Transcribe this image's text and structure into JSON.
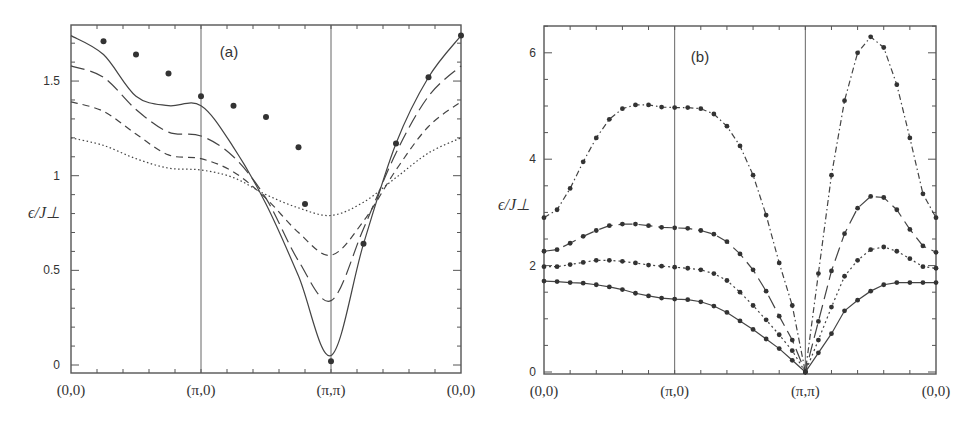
{
  "figure": {
    "panels": [
      {
        "id": "a",
        "label": "(a)",
        "ylabel": "ϵ/J⊥"
      },
      {
        "id": "b",
        "label": "(b)",
        "ylabel": "ϵ/J⊥"
      }
    ]
  },
  "chart_data": [
    {
      "type": "line",
      "title": "(a)",
      "xlabel": "",
      "ylabel": "ϵ/J⊥",
      "x_tick_labels": [
        "(0,0)",
        "(π,0)",
        "(π,π)",
        "(0,0)"
      ],
      "x_tick_positions": [
        0,
        1,
        2,
        3
      ],
      "y_tick_labels": [
        "0",
        "0.5",
        "1",
        "1.5"
      ],
      "y_ticks": [
        0,
        0.5,
        1,
        1.5
      ],
      "ylim": [
        -0.02,
        1.84
      ],
      "xlim": [
        0,
        3
      ],
      "grid": false,
      "vertical_lines_at": [
        1,
        2
      ],
      "x": [
        0,
        0.25,
        0.5,
        0.75,
        1.0,
        1.25,
        1.5,
        1.75,
        2.0,
        2.25,
        2.5,
        2.75,
        3.0
      ],
      "series": [
        {
          "name": "solid (with markers)",
          "style": "solid",
          "markers": true,
          "values": [
            1.74,
            1.64,
            1.42,
            1.37,
            1.37,
            1.15,
            0.85,
            0.47,
            0.05,
            0.64,
            1.17,
            1.52,
            1.74
          ],
          "marker_x": [
            0.25,
            0.5,
            0.75,
            1.0,
            1.25,
            1.5,
            1.75,
            1.8,
            2.0,
            2.25,
            2.5,
            2.75,
            3.0
          ],
          "marker_values": [
            1.71,
            1.64,
            1.54,
            1.42,
            1.37,
            1.31,
            1.15,
            0.85,
            0.02,
            0.64,
            1.17,
            1.52,
            1.74
          ]
        },
        {
          "name": "long dash",
          "style": "long-dash",
          "markers": false,
          "values": [
            1.58,
            1.52,
            1.35,
            1.23,
            1.21,
            1.1,
            0.88,
            0.55,
            0.34,
            0.72,
            1.12,
            1.42,
            1.58
          ]
        },
        {
          "name": "short dash",
          "style": "short-dash",
          "markers": false,
          "values": [
            1.39,
            1.34,
            1.22,
            1.11,
            1.09,
            1.02,
            0.88,
            0.7,
            0.58,
            0.76,
            1.03,
            1.26,
            1.39
          ]
        },
        {
          "name": "dotted",
          "style": "dotted",
          "markers": false,
          "values": [
            1.2,
            1.16,
            1.09,
            1.04,
            1.03,
            0.99,
            0.9,
            0.83,
            0.79,
            0.86,
            0.99,
            1.12,
            1.2
          ]
        }
      ]
    },
    {
      "type": "line",
      "title": "(b)",
      "xlabel": "",
      "ylabel": "ϵ/J⊥",
      "x_tick_labels": [
        "(0,0)",
        "(π,0)",
        "(π,π)",
        "(0,0)"
      ],
      "x_tick_positions": [
        0,
        1,
        2,
        3
      ],
      "y_tick_labels": [
        "0",
        "2",
        "4",
        "6"
      ],
      "y_ticks": [
        0,
        2,
        4,
        6
      ],
      "ylim": [
        -0.04,
        6.5
      ],
      "xlim": [
        0,
        3
      ],
      "grid": false,
      "vertical_lines_at": [
        1,
        2
      ],
      "x": [
        0,
        0.1,
        0.2,
        0.3,
        0.4,
        0.5,
        0.6,
        0.7,
        0.8,
        0.9,
        1.0,
        1.1,
        1.2,
        1.3,
        1.4,
        1.5,
        1.6,
        1.7,
        1.8,
        1.9,
        2.0,
        2.1,
        2.2,
        2.3,
        2.4,
        2.5,
        2.6,
        2.7,
        2.8,
        2.9,
        3.0
      ],
      "series": [
        {
          "name": "dash-dot (top)",
          "style": "dash-dot",
          "markers": true,
          "values": [
            2.9,
            3.05,
            3.45,
            3.95,
            4.4,
            4.75,
            4.95,
            5.02,
            5.02,
            4.98,
            4.97,
            4.97,
            4.95,
            4.85,
            4.62,
            4.25,
            3.7,
            2.95,
            2.05,
            1.25,
            0.0,
            1.85,
            3.7,
            5.1,
            6.0,
            6.3,
            6.1,
            5.4,
            4.4,
            3.35,
            2.9
          ]
        },
        {
          "name": "long dash",
          "style": "long-dash",
          "markers": true,
          "values": [
            2.27,
            2.3,
            2.42,
            2.55,
            2.66,
            2.75,
            2.78,
            2.78,
            2.75,
            2.72,
            2.71,
            2.7,
            2.66,
            2.59,
            2.45,
            2.22,
            1.92,
            1.52,
            1.05,
            0.6,
            0.0,
            0.95,
            1.9,
            2.6,
            3.08,
            3.3,
            3.28,
            3.05,
            2.68,
            2.37,
            2.25
          ]
        },
        {
          "name": "dotted-dot",
          "style": "dot-dash",
          "markers": true,
          "values": [
            1.98,
            1.98,
            2.02,
            2.06,
            2.1,
            2.1,
            2.08,
            2.05,
            2.01,
            1.99,
            1.97,
            1.95,
            1.92,
            1.85,
            1.72,
            1.5,
            1.25,
            0.98,
            0.7,
            0.4,
            0.0,
            0.6,
            1.22,
            1.8,
            2.1,
            2.3,
            2.35,
            2.27,
            2.13,
            1.98,
            1.95
          ]
        },
        {
          "name": "solid",
          "style": "solid",
          "markers": true,
          "values": [
            1.71,
            1.7,
            1.68,
            1.67,
            1.64,
            1.6,
            1.55,
            1.48,
            1.43,
            1.39,
            1.37,
            1.36,
            1.32,
            1.24,
            1.12,
            0.96,
            0.8,
            0.62,
            0.44,
            0.22,
            0.0,
            0.36,
            0.72,
            1.15,
            1.35,
            1.52,
            1.64,
            1.68,
            1.68,
            1.68,
            1.68
          ]
        }
      ]
    }
  ]
}
